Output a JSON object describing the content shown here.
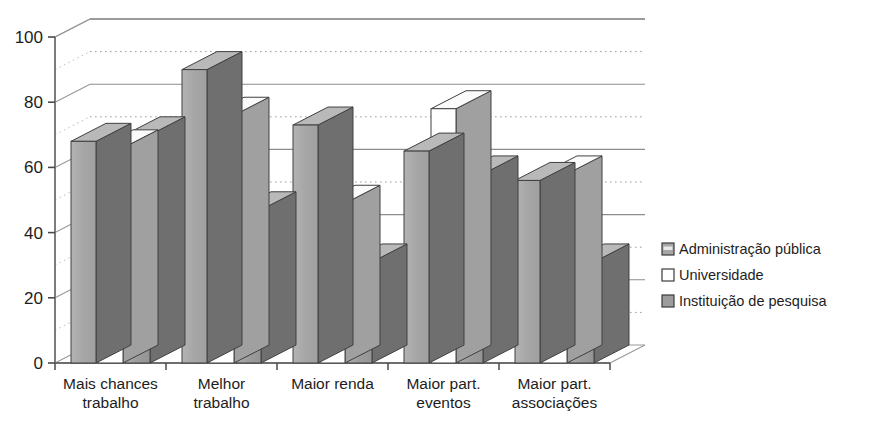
{
  "chart_data": {
    "type": "bar",
    "title": "",
    "subtitle": "",
    "xlabel": "",
    "ylabel": "",
    "ylim": [
      0,
      100
    ],
    "ytick_values": [
      0,
      20,
      40,
      60,
      80,
      100
    ],
    "ytick_labels": [
      "0",
      "20",
      "40",
      "60",
      "80",
      "100"
    ],
    "minor_gridline_values": [
      10,
      30,
      50,
      70,
      90
    ],
    "grid": "major solid horizontal lines plus dotted minor lines",
    "legend_position": "right",
    "style": "3d-grouped-bars",
    "categories": [
      "Mais chances trabalho",
      "Melhor trabalho",
      "Maior renda",
      "Maior part. eventos",
      "Maior part. associações"
    ],
    "category_lines": [
      [
        "Mais chances",
        "trabalho"
      ],
      [
        "Melhor",
        "trabalho"
      ],
      [
        "Maior renda",
        ""
      ],
      [
        "Maior part.",
        "eventos"
      ],
      [
        "Maior part.",
        "associações"
      ]
    ],
    "series": [
      {
        "name": "Administração  pública",
        "color": "#a6a6a6",
        "values": [
          68,
          90,
          73,
          65,
          56
        ]
      },
      {
        "name": "Universidade",
        "color": "#ffffff",
        "values": [
          66,
          76,
          49,
          78,
          58
        ]
      },
      {
        "name": "Instituição de pesquisa",
        "color": "#9c9c9c",
        "values": [
          70,
          47,
          31,
          58,
          31
        ]
      }
    ]
  },
  "legend": {
    "items": [
      {
        "label": "Administração  pública",
        "swatch": "gray-banded"
      },
      {
        "label": "Universidade",
        "swatch": "white"
      },
      {
        "label": "Instituição de pesquisa",
        "swatch": "gray-solid"
      }
    ]
  },
  "axes": {
    "y": {
      "ticks": [
        "0",
        "20",
        "40",
        "60",
        "80",
        "100"
      ]
    }
  }
}
